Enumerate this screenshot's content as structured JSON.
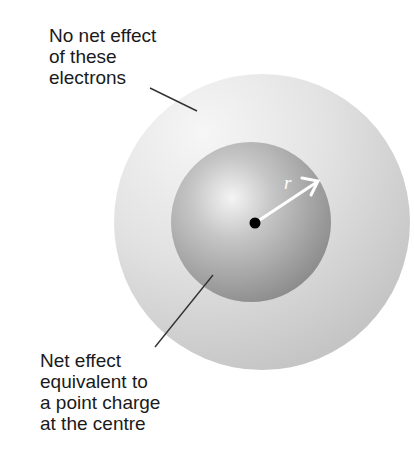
{
  "diagram": {
    "top_label": {
      "lines": [
        "No net effect",
        "of these",
        "electrons"
      ]
    },
    "bottom_label": {
      "lines": [
        "Net effect",
        "equivalent to",
        "a point charge",
        "at the centre"
      ]
    },
    "radius_label": "r",
    "colors": {
      "background": "#ffffff",
      "outer_shell_light": "#f4f4f4",
      "outer_shell_dark": "#c4c4c4",
      "inner_sphere_highlight": "#f2f2f2",
      "inner_sphere_edge": "#858585",
      "point_charge": "#000000",
      "radius_arrow": "#ffffff",
      "leader_lines": "#333333",
      "text": "#1a1a1a"
    }
  }
}
